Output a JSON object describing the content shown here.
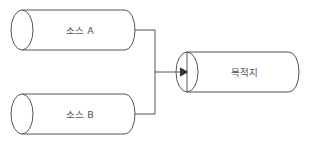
{
  "diagram": {
    "type": "data-flow",
    "nodes": [
      {
        "id": "source-a",
        "label": "소스 A",
        "shape": "cylinder"
      },
      {
        "id": "source-b",
        "label": "소스 B",
        "shape": "cylinder"
      },
      {
        "id": "destination",
        "label": "목적지",
        "shape": "cylinder"
      }
    ],
    "edges": [
      {
        "from": "source-a",
        "to": "destination"
      },
      {
        "from": "source-b",
        "to": "destination"
      }
    ],
    "colors": {
      "stroke": "#555555",
      "background": "#ffffff",
      "text": "#555555"
    }
  }
}
